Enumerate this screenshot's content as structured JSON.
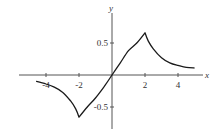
{
  "chart_data": {
    "type": "line",
    "title": "",
    "xlabel": "x",
    "ylabel": "y",
    "xlim": [
      -5.2,
      5.6
    ],
    "ylim": [
      -0.85,
      0.95
    ],
    "grid": false,
    "legend": null,
    "x_ticks": [
      -4,
      -2,
      2,
      4
    ],
    "x_tick_labels": [
      "-4",
      "-2",
      "2",
      "4"
    ],
    "y_ticks": [
      0.5,
      -0.5
    ],
    "y_tick_labels": [
      "0.5",
      "-0.5"
    ],
    "series": [
      {
        "name": "f(x)",
        "x": [
          -4.6,
          -4,
          -3.5,
          -3,
          -2.5,
          -2.2,
          -2,
          -1.5,
          -1,
          -0.5,
          0,
          0.5,
          1,
          1.5,
          2,
          2.2,
          2.5,
          3,
          3.5,
          4,
          4.5,
          5
        ],
        "y": [
          -0.1,
          -0.14,
          -0.19,
          -0.27,
          -0.41,
          -0.53,
          -0.66,
          -0.5,
          -0.36,
          -0.19,
          0,
          0.19,
          0.38,
          0.5,
          0.66,
          0.53,
          0.41,
          0.27,
          0.19,
          0.15,
          0.12,
          0.11
        ]
      }
    ],
    "annotations": []
  },
  "axes": {
    "x_label": "x",
    "y_label": "y",
    "x_tick_labels": [
      "-4",
      "-2",
      "2",
      "4"
    ],
    "y_tick_labels": [
      "0.5",
      "-0.5"
    ]
  },
  "colors": {
    "axis": "#555555",
    "curve": "#1a1a1a",
    "text": "#333333"
  }
}
